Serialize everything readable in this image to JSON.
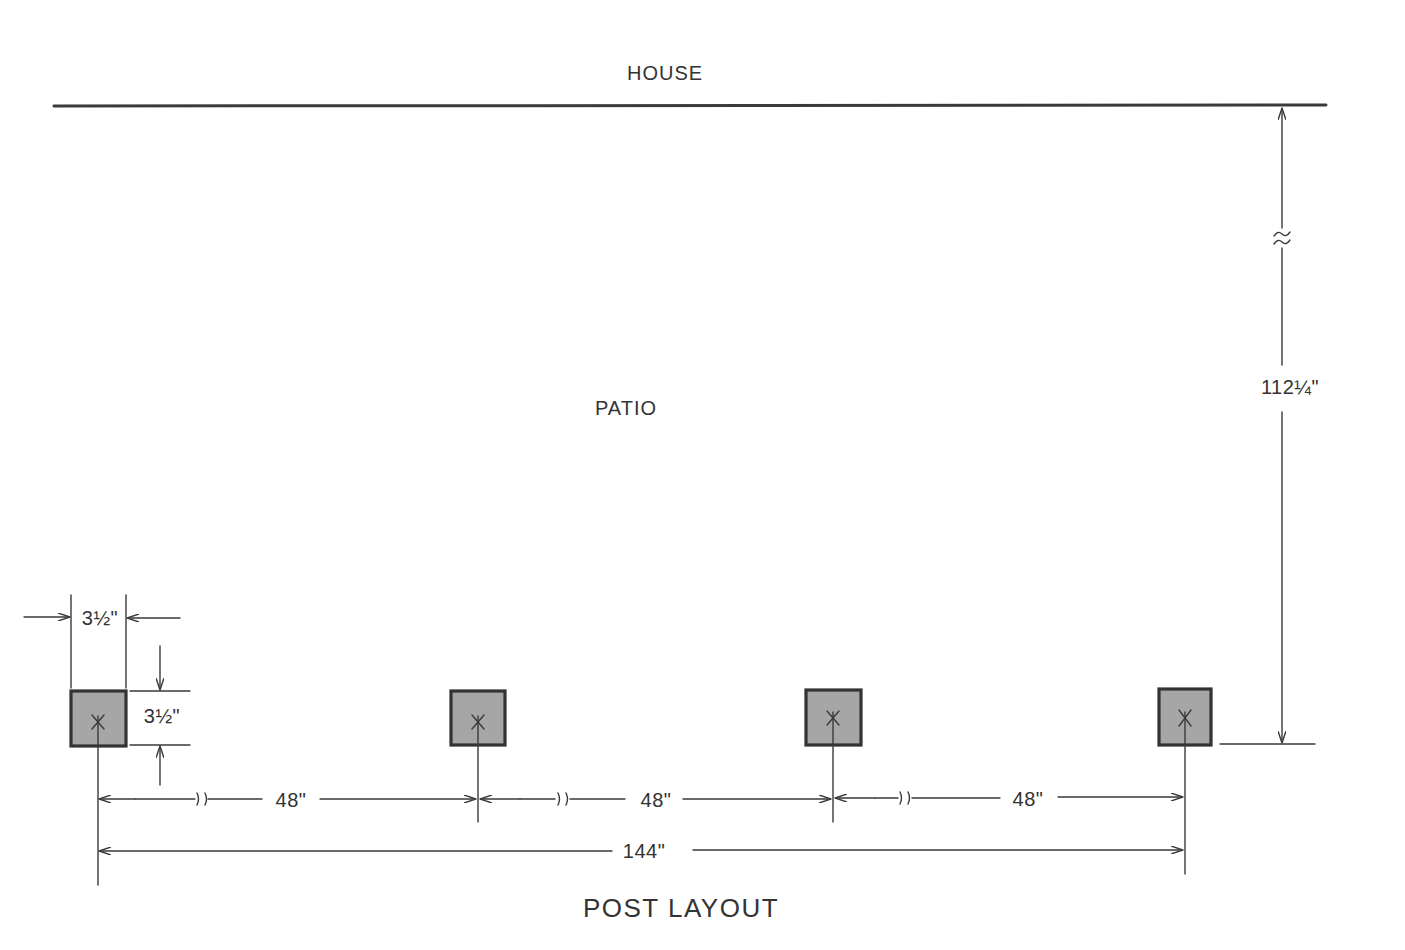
{
  "labels": {
    "house": "HOUSE",
    "patio": "PATIO",
    "title": "POST LAYOUT"
  },
  "dimensions": {
    "post_width": "3½\"",
    "post_depth": "3½\"",
    "house_to_posts": "112¼\"",
    "spacing_1": "48\"",
    "spacing_2": "48\"",
    "spacing_3": "48\"",
    "overall": "144\""
  },
  "posts": [
    {
      "id": 1,
      "center_x": 98
    },
    {
      "id": 2,
      "center_x": 477
    },
    {
      "id": 3,
      "center_x": 833
    },
    {
      "id": 4,
      "center_x": 1185
    }
  ],
  "colors": {
    "line": "#3a3a3a",
    "post_fill": "#a6a6a6",
    "background": "#ffffff"
  }
}
